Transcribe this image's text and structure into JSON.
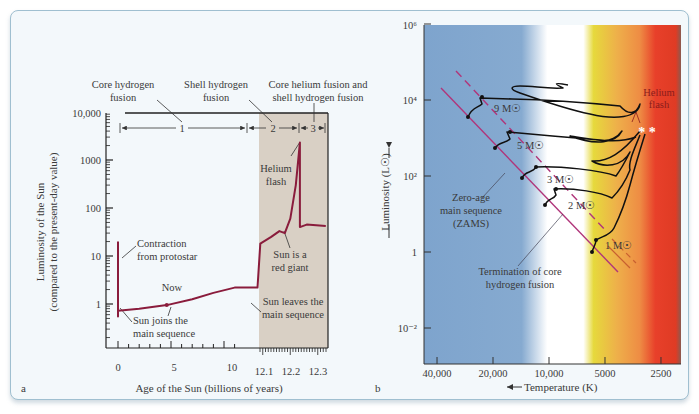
{
  "chart_data": [
    {
      "type": "line",
      "panel_label": "a",
      "title": "",
      "xlabel": "Age of the Sun (billions of years)",
      "ylabel": "Luminosity of the Sun",
      "ylabel2": "(compared to the present-day value)",
      "yscale": "log",
      "ylim": [
        0.12,
        10000
      ],
      "y_ticks": [
        "10,000",
        "1000",
        "100",
        "10",
        "1"
      ],
      "y_tick_values": [
        10000,
        1000,
        100,
        10,
        1
      ],
      "x_ticks_main": [
        "0",
        "5",
        "10"
      ],
      "x_ticks_main_values": [
        0,
        5,
        10
      ],
      "x_ticks_zoom": [
        "12.1",
        "12.2",
        "12.3"
      ],
      "x_ticks_zoom_values": [
        12.1,
        12.2,
        12.3
      ],
      "shaded_region": {
        "from": 12.06,
        "to": 12.33,
        "color": "#d8cfc4"
      },
      "line_color": "#8a1c3c",
      "series": [
        {
          "name": "Solar luminosity",
          "points": [
            [
              0,
              20
            ],
            [
              0,
              0.55
            ],
            [
              0,
              0.72
            ],
            [
              2,
              0.8
            ],
            [
              4.6,
              0.95
            ],
            [
              7,
              1.25
            ],
            [
              9,
              1.7
            ],
            [
              11,
              2.2
            ],
            [
              12.08,
              2.2
            ],
            [
              12.09,
              18
            ],
            [
              12.13,
              25
            ],
            [
              12.16,
              33
            ],
            [
              12.18,
              30
            ],
            [
              12.2,
              60
            ],
            [
              12.22,
              300
            ],
            [
              12.235,
              2300
            ],
            [
              12.235,
              40
            ],
            [
              12.26,
              45
            ],
            [
              12.33,
              42
            ]
          ]
        }
      ],
      "phases": [
        {
          "label": "1",
          "name": "Core hydrogen fusion"
        },
        {
          "label": "2",
          "name": "Shell hydrogen fusion"
        },
        {
          "label": "3",
          "name": "Core helium fusion and shell hydrogen fusion"
        }
      ],
      "annotations": {
        "core_h_1": "Core hydrogen",
        "core_h_2": "fusion",
        "shell_h_1": "Shell hydrogen",
        "shell_h_2": "fusion",
        "core_he_1": "Core helium fusion and",
        "core_he_2": "shell hydrogen fusion",
        "contraction_1": "Contraction",
        "contraction_2": "from protostar",
        "now": "Now",
        "joins_1": "Sun joins the",
        "joins_2": "main sequence",
        "leaves_1": "Sun leaves the",
        "leaves_2": "main sequence",
        "redgiant_1": "Sun is a",
        "redgiant_2": "red giant",
        "heflash_1": "Helium",
        "heflash_2": "flash"
      }
    },
    {
      "type": "line",
      "panel_label": "b",
      "title": "",
      "xlabel": "Temperature (K)",
      "xlabel_arrow": "←",
      "ylabel": "Luminosity (L☉)",
      "yscale": "log",
      "xscale": "log-reversed",
      "ylim": [
        0.001,
        1000000
      ],
      "xlim": [
        50000,
        2000
      ],
      "y_ticks": [
        "10⁶",
        "10⁴",
        "10²",
        "1",
        "10⁻²"
      ],
      "y_tick_values": [
        1000000,
        10000,
        100,
        1,
        0.01
      ],
      "x_ticks": [
        "40,000",
        "20,000",
        "10,000",
        "5000",
        "2500"
      ],
      "x_tick_values": [
        40000,
        20000,
        10000,
        5000,
        2500
      ],
      "background_bands": [
        "#7fa6cf",
        "#ffffff",
        "#e4d83a",
        "#f0a94a",
        "#e8452a"
      ],
      "zams_color": "#b0357a",
      "track_color": "#111111",
      "series": [
        {
          "name": "9 M☉",
          "label": "9 M☉"
        },
        {
          "name": "5 M☉",
          "label": "5 M☉"
        },
        {
          "name": "3 M☉",
          "label": "3 M☉"
        },
        {
          "name": "2 M☉",
          "label": "2 M☉"
        },
        {
          "name": "1 M☉",
          "label": "1 M☉"
        }
      ],
      "annotations": {
        "zams_1": "Zero-age",
        "zams_2": "main sequence",
        "zams_3": "(ZAMS)",
        "term_1": "Termination of core",
        "term_2": "hydrogen fusion",
        "heflash_1": "Helium",
        "heflash_2": "flash",
        "stars": "* *"
      }
    }
  ]
}
